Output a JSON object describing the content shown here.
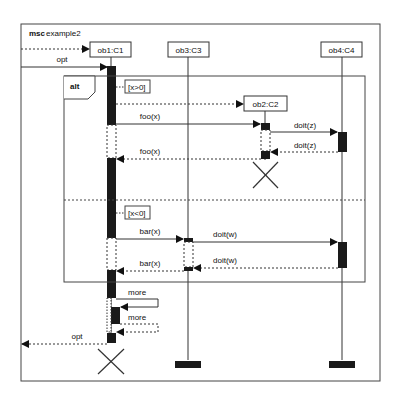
{
  "diagram": {
    "type": "msc",
    "title_keyword": "msc",
    "title_name": "example2",
    "objects": [
      {
        "id": "ob1",
        "label": "ob1:C1"
      },
      {
        "id": "ob3",
        "label": "ob3:C3"
      },
      {
        "id": "ob4",
        "label": "ob4:C4"
      },
      {
        "id": "ob2",
        "label": "ob2:C2"
      }
    ],
    "fragments": {
      "alt_label": "alt",
      "guard1": "[x>0]",
      "guard2": "[x<0]"
    },
    "messages": {
      "opt_in": "opt",
      "foo_call": "foo(x)",
      "doit_z_call": "doit(z)",
      "doit_z_return": "doit(z)",
      "foo_return": "foo(x)",
      "bar_call": "bar(x)",
      "doit_w_call": "doit(w)",
      "doit_w_return": "doit(w)",
      "bar_return": "bar(x)",
      "more_self_call": "more",
      "more_self_return": "more",
      "opt_out": "opt"
    },
    "colors": {
      "line": "#333333",
      "activation": "#1a1a1a",
      "background": "#ffffff"
    }
  }
}
